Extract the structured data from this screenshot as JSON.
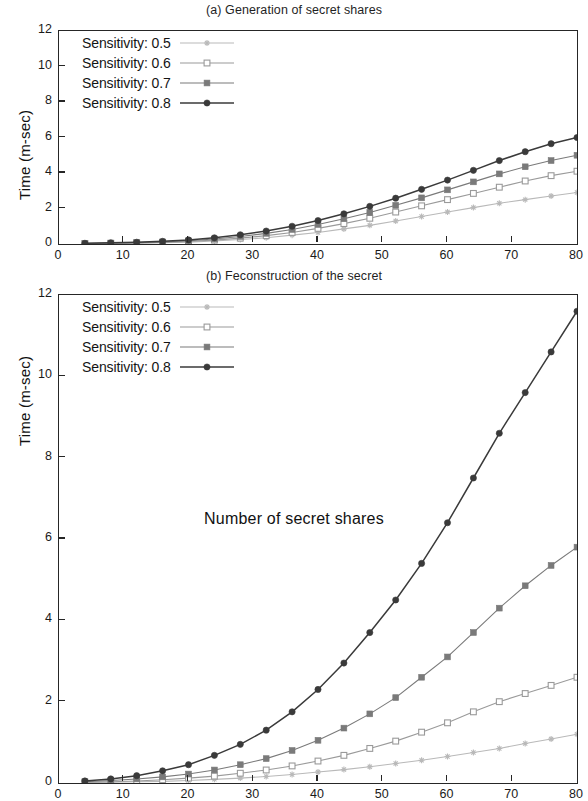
{
  "figure": {
    "xaxis_title": "Number of secret shares",
    "yaxis_title": "Time (m-sec)"
  },
  "panels": [
    {
      "id": "a",
      "title": "(a) Generation of secret shares",
      "ylabel": "Time (m-sec)",
      "ytick_labels": [
        "0",
        "2",
        "4",
        "6",
        "8",
        "10",
        "12"
      ],
      "xtick_labels": [
        "0",
        "10",
        "20",
        "30",
        "40",
        "50",
        "60",
        "70",
        "80"
      ]
    },
    {
      "id": "b",
      "title": "(b) Feconstruction of the secret",
      "ylabel": "Time (m-sec)",
      "ytick_labels": [
        "0",
        "2",
        "4",
        "6",
        "8",
        "10",
        "12"
      ],
      "xtick_labels": [
        "0",
        "10",
        "20",
        "30",
        "40",
        "50",
        "60",
        "70",
        "80"
      ]
    }
  ],
  "legend": {
    "entries": [
      {
        "label": "Sensitivity: 0.5",
        "marker": "star",
        "color": "#b9b9b9"
      },
      {
        "label": "Sensitivity: 0.6",
        "marker": "open-square",
        "color": "#9a9a9a"
      },
      {
        "label": "Sensitivity: 0.7",
        "marker": "filled-square",
        "color": "#7a7a7a"
      },
      {
        "label": "Sensitivity: 0.8",
        "marker": "filled-circle",
        "color": "#3a3a3a"
      }
    ]
  },
  "chart_data": [
    {
      "type": "line",
      "title": "(a) Generation of secret shares",
      "xlabel": "Number of secret shares",
      "ylabel": "Time (m-sec)",
      "xlim": [
        0,
        80
      ],
      "ylim": [
        0,
        12
      ],
      "xticks": [
        0,
        10,
        20,
        30,
        40,
        50,
        60,
        70,
        80
      ],
      "yticks": [
        0,
        2,
        4,
        6,
        8,
        10,
        12
      ],
      "grid": false,
      "legend_position": "upper-left",
      "x": [
        4,
        8,
        12,
        16,
        20,
        24,
        28,
        32,
        36,
        40,
        44,
        48,
        52,
        56,
        60,
        64,
        68,
        72,
        76,
        80
      ],
      "series": [
        {
          "name": "Sensitivity: 0.5",
          "marker": "star",
          "color": "#b9b9b9",
          "values": [
            0.02,
            0.03,
            0.05,
            0.07,
            0.1,
            0.17,
            0.25,
            0.35,
            0.5,
            0.65,
            0.85,
            1.05,
            1.3,
            1.55,
            1.8,
            2.05,
            2.3,
            2.5,
            2.7,
            2.9
          ]
        },
        {
          "name": "Sensitivity: 0.6",
          "marker": "open-square",
          "color": "#9a9a9a",
          "values": [
            0.02,
            0.04,
            0.06,
            0.09,
            0.14,
            0.22,
            0.33,
            0.47,
            0.65,
            0.88,
            1.15,
            1.45,
            1.8,
            2.15,
            2.5,
            2.85,
            3.2,
            3.55,
            3.85,
            4.1
          ]
        },
        {
          "name": "Sensitivity: 0.7",
          "marker": "filled-square",
          "color": "#7a7a7a",
          "values": [
            0.03,
            0.05,
            0.08,
            0.12,
            0.18,
            0.28,
            0.42,
            0.6,
            0.82,
            1.1,
            1.42,
            1.78,
            2.18,
            2.6,
            3.05,
            3.5,
            3.95,
            4.35,
            4.7,
            5.0
          ]
        },
        {
          "name": "Sensitivity: 0.8",
          "marker": "filled-circle",
          "color": "#3a3a3a",
          "values": [
            0.04,
            0.07,
            0.1,
            0.15,
            0.23,
            0.35,
            0.52,
            0.73,
            1.0,
            1.32,
            1.7,
            2.12,
            2.58,
            3.08,
            3.6,
            4.15,
            4.7,
            5.2,
            5.65,
            6.0
          ]
        }
      ]
    },
    {
      "type": "line",
      "title": "(b) Feconstruction of the secret",
      "xlabel": "Number of secret shares",
      "ylabel": "Time (m-sec)",
      "xlim": [
        0,
        80
      ],
      "ylim": [
        0,
        12
      ],
      "xticks": [
        0,
        10,
        20,
        30,
        40,
        50,
        60,
        70,
        80
      ],
      "yticks": [
        0,
        2,
        4,
        6,
        8,
        10,
        12
      ],
      "grid": false,
      "legend_position": "upper-left",
      "x": [
        4,
        8,
        12,
        16,
        20,
        24,
        28,
        32,
        36,
        40,
        44,
        48,
        52,
        56,
        60,
        64,
        68,
        72,
        76,
        80
      ],
      "series": [
        {
          "name": "Sensitivity: 0.5",
          "marker": "star",
          "color": "#b9b9b9",
          "values": [
            0.01,
            0.02,
            0.03,
            0.04,
            0.06,
            0.09,
            0.12,
            0.16,
            0.21,
            0.27,
            0.33,
            0.4,
            0.48,
            0.56,
            0.65,
            0.75,
            0.85,
            0.97,
            1.08,
            1.2
          ]
        },
        {
          "name": "Sensitivity: 0.6",
          "marker": "open-square",
          "color": "#9a9a9a",
          "values": [
            0.02,
            0.03,
            0.05,
            0.08,
            0.12,
            0.17,
            0.24,
            0.32,
            0.42,
            0.54,
            0.68,
            0.85,
            1.03,
            1.25,
            1.48,
            1.75,
            2.0,
            2.2,
            2.4,
            2.6
          ]
        },
        {
          "name": "Sensitivity: 0.7",
          "marker": "filled-square",
          "color": "#7a7a7a",
          "values": [
            0.03,
            0.06,
            0.1,
            0.15,
            0.22,
            0.32,
            0.45,
            0.6,
            0.8,
            1.05,
            1.35,
            1.7,
            2.1,
            2.6,
            3.1,
            3.7,
            4.3,
            4.85,
            5.35,
            5.8
          ]
        },
        {
          "name": "Sensitivity: 0.8",
          "marker": "filled-circle",
          "color": "#3a3a3a",
          "values": [
            0.05,
            0.1,
            0.18,
            0.3,
            0.45,
            0.68,
            0.95,
            1.3,
            1.75,
            2.3,
            2.95,
            3.7,
            4.5,
            5.4,
            6.4,
            7.5,
            8.6,
            9.6,
            10.6,
            11.6
          ]
        }
      ]
    }
  ]
}
